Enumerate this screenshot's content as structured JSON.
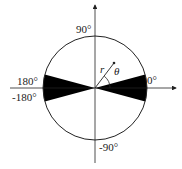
{
  "diagram": {
    "type": "polar-coordinate-schematic",
    "labels": {
      "top": "90°",
      "bottom": "-90°",
      "right": "0°",
      "left_upper": "180°",
      "left_lower": "-180°",
      "radius": "r",
      "angle": "θ"
    },
    "caption": "",
    "colors": {
      "stroke": "#222222",
      "fill_wedge": "#000000",
      "background": "#ffffff"
    },
    "geometry": {
      "center": [
        95,
        88
      ],
      "radius": 52,
      "wedge_half_angle_deg": 15,
      "vector_angle_deg": 52
    }
  }
}
